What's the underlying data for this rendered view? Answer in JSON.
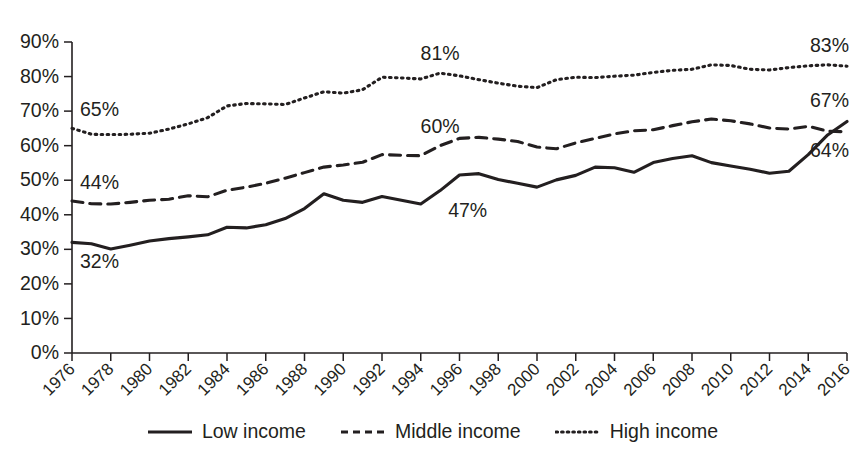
{
  "chart_data": {
    "type": "line",
    "title": "",
    "subtitle": "",
    "xlabel": "",
    "ylabel": "",
    "xlim": [
      1976,
      2016
    ],
    "ylim": [
      0,
      90
    ],
    "grid": false,
    "legend_position": "bottom-center",
    "y_ticks": [
      "0%",
      "10%",
      "20%",
      "30%",
      "40%",
      "50%",
      "60%",
      "70%",
      "80%",
      "90%"
    ],
    "y_tick_values": [
      0,
      10,
      20,
      30,
      40,
      50,
      60,
      70,
      80,
      90
    ],
    "x_ticks": [
      "1976",
      "1978",
      "1980",
      "1982",
      "1984",
      "1986",
      "1988",
      "1990",
      "1992",
      "1994",
      "1996",
      "1998",
      "2000",
      "2002",
      "2004",
      "2006",
      "2008",
      "2010",
      "2012",
      "2014",
      "2016"
    ],
    "x_tick_values": [
      1976,
      1978,
      1980,
      1982,
      1984,
      1986,
      1988,
      1990,
      1992,
      1994,
      1996,
      1998,
      2000,
      2002,
      2004,
      2006,
      2008,
      2010,
      2012,
      2014,
      2016
    ],
    "x": [
      1976,
      1977,
      1978,
      1979,
      1980,
      1981,
      1982,
      1983,
      1984,
      1985,
      1986,
      1987,
      1988,
      1989,
      1990,
      1991,
      1992,
      1993,
      1994,
      1995,
      1996,
      1997,
      1998,
      1999,
      2000,
      2001,
      2002,
      2003,
      2004,
      2005,
      2006,
      2007,
      2008,
      2009,
      2010,
      2011,
      2012,
      2013,
      2014,
      2015,
      2016
    ],
    "series": [
      {
        "name": "Low income",
        "style": "solid",
        "color": "#231f20",
        "values": [
          32,
          31.6,
          30.1,
          31.2,
          32.4,
          33.1,
          33.6,
          34.2,
          36.4,
          36.2,
          37.1,
          38.9,
          41.8,
          46.1,
          44.2,
          43.6,
          45.3,
          44.2,
          43.1,
          47,
          51.5,
          51.9,
          50.2,
          49.1,
          48,
          50.1,
          51.4,
          53.8,
          53.6,
          52.3,
          55.1,
          56.3,
          57.1,
          55.1,
          54.1,
          53.2,
          52,
          52.6,
          57.4,
          63.1,
          67
        ]
      },
      {
        "name": "Middle income",
        "style": "dashed",
        "color": "#231f20",
        "values": [
          44,
          43.2,
          43.1,
          43.6,
          44.2,
          44.5,
          45.5,
          45.2,
          47.1,
          48,
          49.1,
          50.6,
          52.2,
          53.8,
          54.4,
          55.2,
          57.4,
          57.2,
          57.1,
          60,
          62.1,
          62.4,
          61.9,
          61.2,
          59.6,
          59.1,
          60.8,
          62.1,
          63.4,
          64.3,
          64.6,
          65.8,
          66.9,
          67.7,
          67.2,
          66.3,
          65.1,
          64.8,
          65.6,
          64.2,
          64
        ]
      },
      {
        "name": "High income",
        "style": "dotted",
        "color": "#231f20",
        "values": [
          65,
          63.3,
          63.2,
          63.3,
          63.6,
          64.8,
          66.3,
          68.1,
          71.5,
          72.2,
          72.1,
          71.9,
          73.8,
          75.6,
          75.2,
          76.2,
          79.8,
          79.6,
          79.3,
          81,
          80.2,
          79.1,
          78.1,
          77.2,
          76.8,
          79.1,
          79.8,
          79.7,
          80.1,
          80.4,
          81.2,
          81.8,
          82.1,
          83.4,
          83.2,
          82.1,
          81.9,
          82.6,
          83.1,
          83.4,
          83
        ]
      }
    ],
    "annotations": [
      {
        "text": "65%",
        "series": "High income",
        "year": 1976,
        "anchor": "above-right"
      },
      {
        "text": "44%",
        "series": "Middle income",
        "year": 1976,
        "anchor": "above-right"
      },
      {
        "text": "32%",
        "series": "Low income",
        "year": 1976,
        "anchor": "below-right"
      },
      {
        "text": "81%",
        "series": "High income",
        "year": 1995,
        "anchor": "above"
      },
      {
        "text": "60%",
        "series": "Middle income",
        "year": 1995,
        "anchor": "above"
      },
      {
        "text": "47%",
        "series": "Low income",
        "year": 1995,
        "anchor": "below-right"
      },
      {
        "text": "83%",
        "series": "High income",
        "year": 2016,
        "anchor": "above-left"
      },
      {
        "text": "67%",
        "series": "Low income",
        "year": 2016,
        "anchor": "above-left"
      },
      {
        "text": "64%",
        "series": "Middle income",
        "year": 2016,
        "anchor": "below-left"
      }
    ]
  },
  "legend": {
    "items": [
      {
        "label": "Low income",
        "style": "solid"
      },
      {
        "label": "Middle income",
        "style": "dashed"
      },
      {
        "label": "High income",
        "style": "dotted"
      }
    ]
  }
}
